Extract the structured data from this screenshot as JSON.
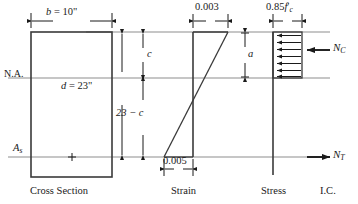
{
  "figure": {
    "panels": [
      "Cross Section",
      "Strain",
      "Stress",
      "I.C."
    ]
  },
  "cross_section": {
    "caption": "Cross Section",
    "width_label_prefix": "b",
    "width_label_eq": " = 10\"",
    "width_label": "b = 10\"",
    "depth_label": "d = 23\"",
    "depth_label_prefix": "d",
    "depth_label_eq": " = 23\"",
    "neutral_axis_label": "N.A.",
    "steel_label_base": "A",
    "steel_label_sub": "s",
    "steel_label": "As",
    "rebar_marker": "+"
  },
  "dimensions": {
    "c_label": "c",
    "below_c_label": "23 − c",
    "a_label": "a"
  },
  "strain": {
    "caption": "Strain",
    "top_value": "0.003",
    "bottom_value": "0.005"
  },
  "stress": {
    "caption": "Stress",
    "block_label_num": "0.85",
    "block_label_f": "f",
    "block_label_prime": "′",
    "block_label_sub": "c",
    "block_label": "0.85f′c",
    "arrow_count": 7
  },
  "internal_couple": {
    "caption": "I.C.",
    "compression_base": "N",
    "compression_sub": "C",
    "compression_label": "NC",
    "tension_base": "N",
    "tension_sub": "T",
    "tension_label": "NT"
  },
  "colors": {
    "ink": "#1a1a1a",
    "rule": "#8d8d8d",
    "outline": "#3a3a3a",
    "background": "#ffffff"
  }
}
